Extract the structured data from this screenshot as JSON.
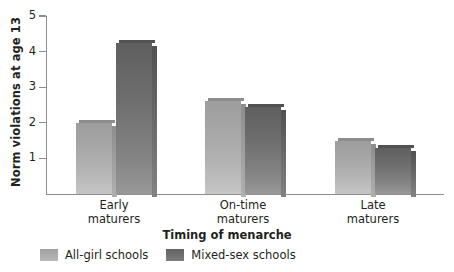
{
  "chart_data": {
    "type": "bar",
    "title": "",
    "xlabel": "Timing of menarche",
    "ylabel": "Norm violations at age 13",
    "categories": [
      "Early maturers",
      "On-time maturers",
      "Late maturers"
    ],
    "category_lines": [
      [
        "Early",
        "maturers"
      ],
      [
        "On-time",
        "maturers"
      ],
      [
        "Late",
        "maturers"
      ]
    ],
    "series": [
      {
        "name": "All-girl schools",
        "color": "#a8a8a8",
        "values": [
          2.0,
          2.6,
          1.5
        ]
      },
      {
        "name": "Mixed-sex schools",
        "color": "#6a6a6a",
        "values": [
          4.25,
          2.45,
          1.3
        ]
      }
    ],
    "ylim": [
      0,
      5
    ],
    "yticks": [
      1,
      2,
      3,
      4,
      5
    ],
    "ytick_labels": [
      "1",
      "2",
      "3",
      "4",
      "5"
    ],
    "grid": false,
    "legend_position": "bottom-left"
  },
  "axes": {
    "y_title": "Norm violations at age 13",
    "x_title": "Timing of menarche"
  },
  "legend": {
    "items": [
      {
        "label": "All-girl schools",
        "swatch": "light-gray-swatch"
      },
      {
        "label": "Mixed-sex schools",
        "swatch": "dark-gray-swatch"
      }
    ]
  }
}
